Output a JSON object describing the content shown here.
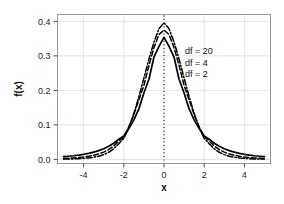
{
  "chart_data": {
    "type": "line",
    "title": "",
    "xlabel": "x",
    "ylabel": "f(x)",
    "xlim": [
      -5.3,
      5.3
    ],
    "ylim": [
      -0.012,
      0.42
    ],
    "xticks": [
      -4,
      -2,
      0,
      2,
      4
    ],
    "xticklabels": [
      "-4",
      "-2",
      "0",
      "2",
      "4"
    ],
    "yticks": [
      0.0,
      0.1,
      0.2,
      0.3,
      0.4
    ],
    "yticklabels": [
      "0.0",
      "0.1",
      "0.2",
      "0.3",
      "0.4"
    ],
    "grid": true,
    "grid_color": "#e4e4e4",
    "frame_color": "#9a9a9a",
    "background": "#ffffff",
    "line_color": "#000000",
    "legend_position": "inside-upper-right",
    "annotations": [
      {
        "text": "df = 20",
        "x": 1.05,
        "y": 0.305
      },
      {
        "text": "df = 4",
        "x": 1.05,
        "y": 0.272
      },
      {
        "text": "df = 2",
        "x": 1.05,
        "y": 0.24
      }
    ],
    "reference_line": {
      "type": "vertical",
      "x": 0,
      "style": "dotted",
      "color": "#1a1a1a"
    },
    "x": [
      -5.0,
      -4.75,
      -4.5,
      -4.25,
      -4.0,
      -3.75,
      -3.5,
      -3.25,
      -3.0,
      -2.75,
      -2.5,
      -2.25,
      -2.0,
      -1.75,
      -1.5,
      -1.25,
      -1.0,
      -0.75,
      -0.5,
      -0.25,
      0.0,
      0.25,
      0.5,
      0.75,
      1.0,
      1.25,
      1.5,
      1.75,
      2.0,
      2.25,
      2.5,
      2.75,
      3.0,
      3.25,
      3.5,
      3.75,
      4.0,
      4.25,
      4.5,
      4.75,
      5.0
    ],
    "series": [
      {
        "name": "df = 2",
        "label": "df = 2",
        "style": "solid",
        "values": [
          0.0077,
          0.009,
          0.0105,
          0.0124,
          0.0147,
          0.0175,
          0.021,
          0.0253,
          0.0308,
          0.0378,
          0.0468,
          0.0585,
          0.068,
          0.0889,
          0.1146,
          0.1464,
          0.1925,
          0.2321,
          0.2962,
          0.3278,
          0.3536,
          0.3278,
          0.2962,
          0.2321,
          0.1925,
          0.1464,
          0.1146,
          0.0889,
          0.068,
          0.0585,
          0.0468,
          0.0378,
          0.0308,
          0.0253,
          0.021,
          0.0175,
          0.0147,
          0.0124,
          0.0105,
          0.009,
          0.0077
        ]
      },
      {
        "name": "df = 4",
        "label": "df = 4",
        "style": "dashed",
        "values": [
          0.0027,
          0.0034,
          0.0043,
          0.0055,
          0.0071,
          0.0092,
          0.012,
          0.0158,
          0.0211,
          0.0283,
          0.0386,
          0.053,
          0.0663,
          0.0943,
          0.1297,
          0.1729,
          0.2146,
          0.272,
          0.324,
          0.362,
          0.375,
          0.362,
          0.324,
          0.272,
          0.2146,
          0.1729,
          0.1297,
          0.0943,
          0.0663,
          0.053,
          0.0386,
          0.0283,
          0.0211,
          0.0158,
          0.012,
          0.0092,
          0.0071,
          0.0055,
          0.0043,
          0.0034,
          0.0027
        ]
      },
      {
        "name": "df = 20",
        "label": "df = 20",
        "style": "dashdot",
        "values": [
          0.0007,
          0.001,
          0.0014,
          0.002,
          0.0029,
          0.0042,
          0.0062,
          0.0092,
          0.0137,
          0.0205,
          0.0307,
          0.0454,
          0.061,
          0.0921,
          0.133,
          0.182,
          0.236,
          0.2905,
          0.34,
          0.379,
          0.396,
          0.379,
          0.34,
          0.2905,
          0.236,
          0.182,
          0.133,
          0.0921,
          0.061,
          0.0454,
          0.0307,
          0.0205,
          0.0137,
          0.0092,
          0.0062,
          0.0042,
          0.0029,
          0.002,
          0.0014,
          0.001,
          0.0007
        ]
      }
    ]
  }
}
